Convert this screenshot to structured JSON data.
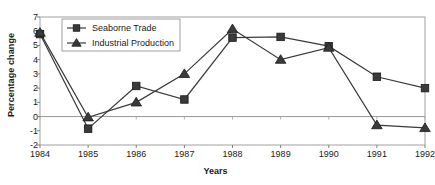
{
  "chart_data": {
    "type": "line",
    "title": "",
    "xlabel": "Years",
    "ylabel": "Percentage change",
    "categories": [
      "1984",
      "1985",
      "1986",
      "1987",
      "1988",
      "1989",
      "1990",
      "1991",
      "1992"
    ],
    "ylim": [
      -2,
      7
    ],
    "yticks": [
      7,
      6,
      5,
      4,
      3,
      2,
      1,
      0,
      -1,
      -2
    ],
    "grid": false,
    "zero_line": true,
    "legend_position": "top-left-inside",
    "series": [
      {
        "name": "Seaborne Trade",
        "marker": "square",
        "values": [
          5.8,
          -0.85,
          2.15,
          1.2,
          5.55,
          5.6,
          4.95,
          2.8,
          2.0
        ]
      },
      {
        "name": "Industrial Production",
        "marker": "triangle",
        "values": [
          5.9,
          -0.05,
          1.0,
          3.0,
          6.15,
          4.0,
          4.85,
          -0.6,
          -0.8
        ]
      }
    ],
    "colors": {
      "series_line": "#3a3a3a",
      "marker_fill": "#3a3a3a",
      "axis": "#808080",
      "text": "#1a1a1a"
    }
  },
  "axis": {
    "y_title": "Percentage change",
    "x_title": "Years"
  },
  "legend": {
    "items": [
      {
        "label": "Seaborne Trade",
        "marker": "square-marker"
      },
      {
        "label": "Industrial Production",
        "marker": "triangle-marker"
      }
    ]
  }
}
